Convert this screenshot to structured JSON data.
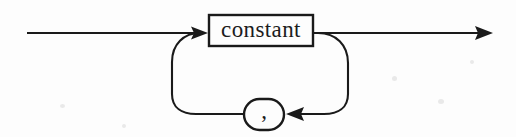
{
  "diagram": {
    "type": "railroad-syntax-diagram",
    "canvas": {
      "width": 516,
      "height": 137,
      "background": "#fdfdfd"
    },
    "ink_color": "#1a1a1a",
    "main_line_y": 33,
    "loop_line_y": 114,
    "entry": {
      "name": "entry-line",
      "x_start": 27,
      "x_end": 200,
      "y": 33
    },
    "exit": {
      "name": "exit-line",
      "x_start": 314,
      "x_end": 492,
      "y": 33,
      "arrow": "right"
    },
    "nodes": [
      {
        "id": "constant",
        "kind": "nonterminal-box",
        "label": "constant",
        "x": 208,
        "y": 14,
        "width": 106,
        "height": 33,
        "shape": "rectangle"
      },
      {
        "id": "comma",
        "kind": "terminal-oval",
        "label": ",",
        "x": 243,
        "y": 98,
        "width": 42,
        "height": 33,
        "shape": "stadium"
      }
    ],
    "arrows": [
      {
        "name": "arrow-into-constant",
        "x": 208,
        "y": 33,
        "direction": "right"
      },
      {
        "name": "arrow-into-comma",
        "x": 288,
        "y": 114,
        "direction": "left"
      },
      {
        "name": "arrow-exit",
        "x": 492,
        "y": 33,
        "direction": "right"
      }
    ],
    "loop": {
      "name": "repeat-loop",
      "description": "return path from after constant, through comma, back to before constant",
      "left_x": 172,
      "right_x": 348,
      "bottom_y": 114
    }
  },
  "labels": {
    "constant": "constant",
    "comma": ","
  }
}
